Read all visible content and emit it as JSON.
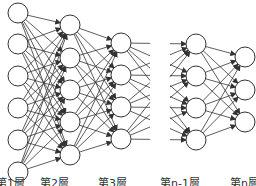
{
  "diagram": {
    "type": "neural-network",
    "colors": {
      "stroke": "#333333",
      "node_fill": "#ffffff",
      "background": "#ffffff"
    },
    "node_radius": 10,
    "layers": [
      {
        "name": "layer-1",
        "x": 18,
        "ys": [
          13,
          44,
          76,
          108,
          140,
          172
        ]
      },
      {
        "name": "layer-2",
        "x": 70,
        "ys": [
          25,
          58,
          90,
          122,
          155
        ]
      },
      {
        "name": "layer-3",
        "x": 121,
        "ys": [
          43,
          75,
          107,
          139
        ]
      },
      {
        "name": "layer-n-1",
        "x": 196,
        "ys": [
          44,
          76,
          108,
          140
        ]
      },
      {
        "name": "layer-n",
        "x": 245,
        "ys": [
          57,
          90,
          122
        ]
      }
    ],
    "gap": {
      "from_x": 150,
      "to_x": 170
    }
  },
  "labels": [
    {
      "text": "第1層",
      "x": -4
    },
    {
      "text": "第2層",
      "x": 40
    },
    {
      "text": "第3層",
      "x": 98
    },
    {
      "text": "第n-1層",
      "x": 160
    },
    {
      "text": "第n層",
      "x": 230
    }
  ]
}
